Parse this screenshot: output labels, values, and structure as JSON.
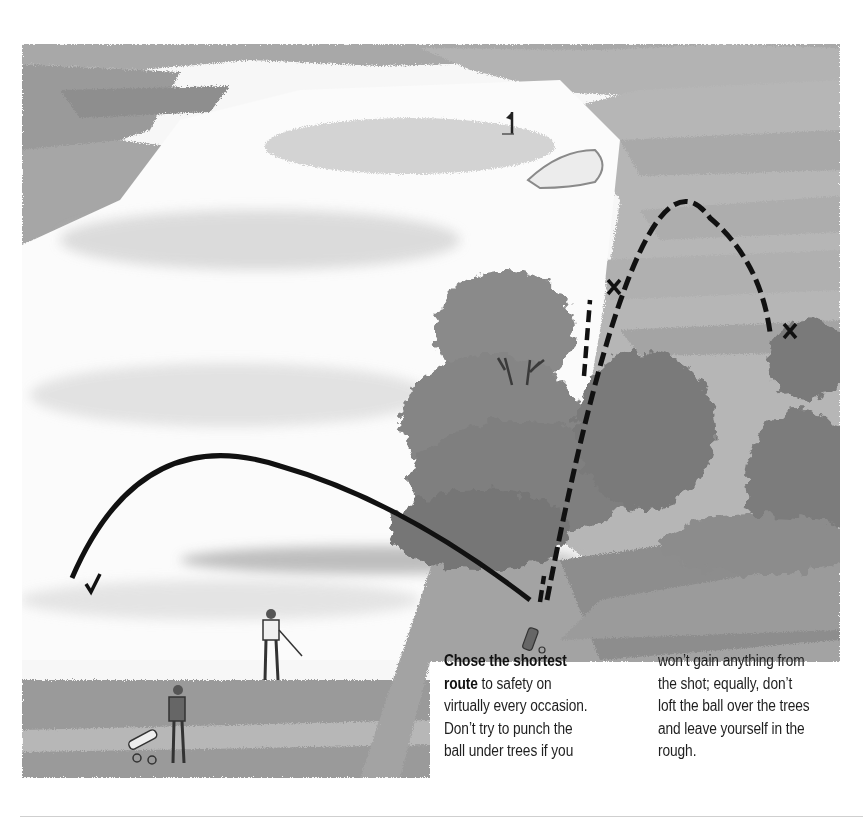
{
  "illustration": {
    "description": "Watercolour illustration of a golf hole: a fairway with the green and flag in the distance, a stand of trees in the middle, golfers with trolleys in the foreground, and two shot trajectories from a ball lying behind the trees.",
    "markers": {
      "safe_shot": {
        "symbol": "✓",
        "style": "solid",
        "label": "shortest route to safety"
      },
      "risky_shot_under_trees": {
        "symbol": "✕",
        "style": "dashed"
      },
      "risky_shot_over_trees": {
        "symbol": "✕",
        "style": "dashed"
      }
    },
    "elements": [
      "green",
      "flag",
      "bunker",
      "trees",
      "golfer-with-club",
      "golfer-with-trolley",
      "golf-trolley"
    ],
    "colors": {
      "ink": "#111111",
      "wash_dark": "#7a7a7a",
      "wash_mid": "#a9a9a9",
      "wash_light": "#d6d6d6",
      "paper": "#ffffff"
    }
  },
  "caption": {
    "left_lines": [
      {
        "bold": "Chose the shortest",
        "text": ""
      },
      {
        "bold": "route",
        "text": " to safety on"
      },
      {
        "bold": "",
        "text": "virtually every occasion."
      },
      {
        "bold": "",
        "text": "Don’t try to punch the"
      },
      {
        "bold": "",
        "text": "ball under trees if you"
      }
    ],
    "right_lines": [
      "won’t gain anything from",
      "the shot; equally, don’t",
      "loft the ball over the trees",
      "and leave yourself in the",
      "rough."
    ]
  }
}
